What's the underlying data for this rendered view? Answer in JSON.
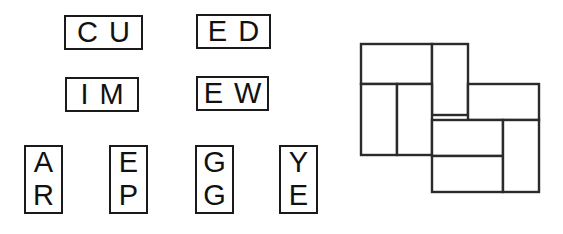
{
  "figure": {
    "caption_present": false,
    "background_color": "#ffffff",
    "ink_color": "#1a1a1a"
  },
  "letter_tiles": {
    "group_name": "lettered-domino-tiles",
    "items": [
      {
        "id": "tile-cu",
        "orientation": "horizontal",
        "letters": [
          "C",
          "U"
        ],
        "x": 64,
        "y": 15,
        "w": 79,
        "h": 35
      },
      {
        "id": "tile-ed",
        "orientation": "horizontal",
        "letters": [
          "E",
          "D"
        ],
        "x": 196,
        "y": 14,
        "w": 75,
        "h": 35
      },
      {
        "id": "tile-im",
        "orientation": "horizontal",
        "letters": [
          "I",
          "M"
        ],
        "x": 65,
        "y": 77,
        "w": 74,
        "h": 35
      },
      {
        "id": "tile-ew",
        "orientation": "horizontal",
        "letters": [
          "E",
          "W"
        ],
        "x": 196,
        "y": 76,
        "w": 73,
        "h": 35
      },
      {
        "id": "tile-ar",
        "orientation": "vertical",
        "letters": [
          "A",
          "R"
        ],
        "x": 24,
        "y": 145,
        "w": 39,
        "h": 69
      },
      {
        "id": "tile-ep",
        "orientation": "vertical",
        "letters": [
          "E",
          "P"
        ],
        "x": 109,
        "y": 145,
        "w": 39,
        "h": 69
      },
      {
        "id": "tile-gg",
        "orientation": "vertical",
        "letters": [
          "G",
          "G"
        ],
        "x": 195,
        "y": 145,
        "w": 39,
        "h": 69
      },
      {
        "id": "tile-ye",
        "orientation": "vertical",
        "letters": [
          "Y",
          "E"
        ],
        "x": 279,
        "y": 145,
        "w": 39,
        "h": 69
      }
    ]
  },
  "tiling_diagram": {
    "name": "pinwheel-rectangle-tiling",
    "viewbox": "0 0 190 165",
    "stroke_color": "#2b2b2b",
    "fill_color": "#ffffff",
    "rectangles": [
      {
        "id": "rect-top-left-horizontal",
        "x": 6,
        "y": 6,
        "w": 71,
        "h": 40
      },
      {
        "id": "rect-top-middle-vertical",
        "x": 77,
        "y": 6,
        "w": 36,
        "h": 71
      },
      {
        "id": "rect-left-vertical-a",
        "x": 6,
        "y": 46,
        "w": 36,
        "h": 71
      },
      {
        "id": "rect-left-vertical-b",
        "x": 42,
        "y": 46,
        "w": 35,
        "h": 71
      },
      {
        "id": "rect-right-horizontal",
        "x": 113,
        "y": 46,
        "w": 71,
        "h": 36
      },
      {
        "id": "rect-bottom-mid-upper",
        "x": 77,
        "y": 82,
        "w": 71,
        "h": 36
      },
      {
        "id": "rect-bottom-mid-lower",
        "x": 77,
        "y": 118,
        "w": 71,
        "h": 36
      },
      {
        "id": "rect-bottom-right-vert",
        "x": 148,
        "y": 82,
        "w": 36,
        "h": 72
      }
    ]
  }
}
